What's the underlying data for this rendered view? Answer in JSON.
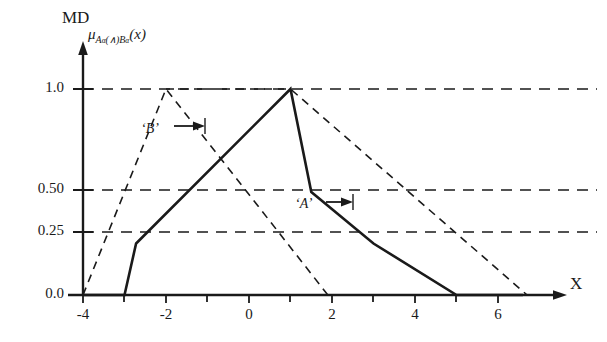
{
  "chart_data": {
    "type": "line",
    "title": "",
    "ylabel": "MD",
    "ylabel_expression": "μ_{Aα(∧)Bα}(x)",
    "xlabel": "X",
    "xlim": [
      -4.4,
      6.9
    ],
    "ylim": [
      0.0,
      1.12
    ],
    "xticks": [
      -4,
      -3,
      -2,
      -1,
      0,
      1,
      2,
      3,
      4,
      5,
      6
    ],
    "xticklabels": [
      "-4",
      "",
      "-2",
      "",
      "0",
      "",
      "2",
      "",
      "4",
      "",
      "6"
    ],
    "yticks": [
      0.0,
      0.25,
      0.5,
      1.0
    ],
    "yticklabels": [
      "0.0",
      "0.25",
      "0.50",
      "1.0"
    ],
    "grid": "horizontal-dashed-at-yticks",
    "legend": "none",
    "series": [
      {
        "name": "intersection",
        "style": "solid",
        "color": "#1a1a1a",
        "points": [
          [
            -4,
            0.0
          ],
          [
            -3,
            0.0
          ],
          [
            -2.72,
            0.25
          ],
          [
            1,
            1.0
          ],
          [
            1.5,
            0.5
          ],
          [
            3,
            0.25
          ],
          [
            5,
            0.0
          ],
          [
            6.6,
            0.0
          ]
        ]
      },
      {
        "name": "B",
        "style": "dashed",
        "color": "#1a1a1a",
        "points": [
          [
            -4,
            0.0
          ],
          [
            -2,
            1.0
          ],
          [
            1.9,
            0.0
          ]
        ]
      },
      {
        "name": "A",
        "style": "dashed",
        "color": "#1a1a1a",
        "points": [
          [
            -2,
            1.0
          ],
          [
            1,
            1.0
          ],
          [
            6.7,
            0.0
          ]
        ]
      }
    ],
    "annotations": [
      {
        "name": "B",
        "text": "‘B’",
        "arrow": "right",
        "target_x": -2.35,
        "target_y": 0.75
      },
      {
        "name": "A",
        "text": "‘A’",
        "arrow": "right",
        "target_x": 1.72,
        "target_y": 0.37
      }
    ]
  },
  "labels": {
    "md": "MD",
    "mu_prefix": "μ",
    "mu_sub_A": "A",
    "mu_sub_alpha1": "α",
    "mu_sub_op": "(∧)",
    "mu_sub_B": "B",
    "mu_sub_alpha2": "α",
    "mu_arg": "(x)",
    "x_axis": "X",
    "ann_b": "‘B’",
    "ann_a": "‘A’"
  },
  "ytick_labels": [
    "1.0",
    "0.50",
    "0.25",
    "0.0"
  ],
  "xtick_labels": [
    "-4",
    "-2",
    "0",
    "2",
    "4",
    "6"
  ],
  "colors": {
    "line": "#1a1a1a",
    "grid": "#1a1a1a",
    "background": "#ffffff"
  }
}
